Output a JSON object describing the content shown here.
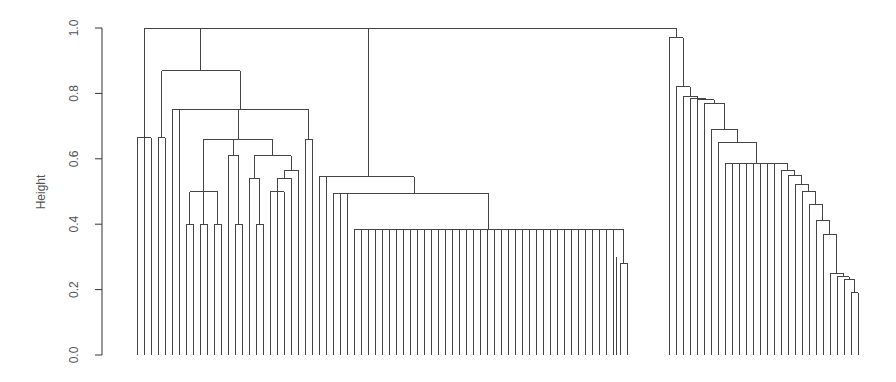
{
  "chart_data": {
    "type": "dendrogram",
    "title": "",
    "xlabel": "",
    "ylabel": "Height",
    "ylim": [
      0,
      1.0
    ],
    "yticks": [
      "0.0",
      "0.2",
      "0.4",
      "0.6",
      "0.8",
      "1.0"
    ],
    "grid": false,
    "leaf_count": 104,
    "plot": {
      "y0_px": 355,
      "y1_px": 28,
      "x_first_leaf": 137,
      "leaf_spacing": 7.0
    },
    "merges_note": "Each segment: [x_leaf_left, x_leaf_right (leaf index positions, may be fractional centers), height, left_child_height, right_child_height]",
    "segments": [
      [
        0,
        0,
        0.665,
        0,
        0
      ],
      [
        0,
        1,
        0.665,
        0,
        0
      ],
      [
        1,
        2,
        0.665,
        0,
        0
      ],
      [
        4,
        5,
        0.665,
        0,
        0
      ],
      [
        9,
        10,
        0.4,
        0,
        0
      ],
      [
        11,
        12,
        0.4,
        0,
        0
      ],
      [
        13,
        14,
        0.4,
        0,
        0
      ],
      [
        16,
        17,
        0.4,
        0,
        0
      ],
      [
        19,
        20,
        0.4,
        0,
        0
      ],
      [
        21,
        22,
        0.4,
        0,
        0
      ],
      [
        9.5,
        13.5,
        0.5,
        0.4,
        0.4
      ],
      [
        9.5,
        11.5,
        0.5,
        0.4,
        0.4
      ],
      [
        15,
        16.5,
        0.61,
        0,
        0.4
      ],
      [
        18,
        19.5,
        0.54,
        0,
        0.4
      ],
      [
        19.5,
        21.5,
        0.5,
        0.4,
        0.4
      ],
      [
        23,
        24,
        0.5,
        0,
        0
      ],
      [
        24,
        25,
        0.5,
        0,
        0
      ],
      [
        26,
        27,
        0.5,
        0,
        0
      ],
      [
        25,
        27,
        0.54,
        0.5,
        0.5
      ],
      [
        28,
        29,
        0.54,
        0,
        0
      ],
      [
        26,
        28.5,
        0.565,
        0.54,
        0.54
      ],
      [
        18.75,
        27,
        0.61,
        0.54,
        0.565
      ],
      [
        11.5,
        15.75,
        0.66,
        0.5,
        0.61
      ],
      [
        15.75,
        22.9,
        0.66,
        0.61,
        0.61
      ],
      [
        30,
        31,
        0.66,
        0,
        0
      ],
      [
        8,
        13.7,
        0.75,
        0,
        0.66
      ],
      [
        13.7,
        30.5,
        0.75,
        0.66,
        0.75
      ],
      [
        33,
        34,
        0.545,
        0,
        0
      ],
      [
        35,
        36,
        0.495,
        0,
        0
      ],
      [
        36,
        37,
        0.495,
        0,
        0
      ],
      [
        33.5,
        36.5,
        0.545,
        0.545,
        0.495
      ],
      [
        38,
        85,
        0.385,
        0,
        0
      ],
      [
        86,
        87,
        0.28,
        0,
        0
      ],
      [
        85,
        86.5,
        0.3,
        0,
        0.28
      ]
    ]
  }
}
